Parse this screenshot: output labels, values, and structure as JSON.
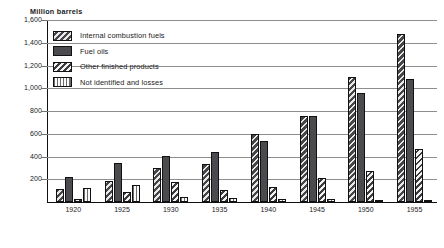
{
  "chart_data": {
    "type": "bar",
    "title": "Million barrels",
    "xlabel": "",
    "ylabel": "Million barrels",
    "ylim": [
      0,
      1600
    ],
    "yticks": [
      0,
      200,
      400,
      600,
      800,
      1000,
      1200,
      1400,
      1600
    ],
    "ytick_labels": [
      "0",
      "200",
      "400",
      "600",
      "800",
      "1,000",
      "1,200",
      "1,400",
      "1,600"
    ],
    "grid": true,
    "legend_position": "upper-left",
    "categories": [
      "1920",
      "1925",
      "1930",
      "1935",
      "1940",
      "1945",
      "1950",
      "1955"
    ],
    "series": [
      {
        "name": "Internal combustion fuels",
        "pattern": "diagonal-stripe-dark",
        "values": [
          115,
          185,
          300,
          330,
          600,
          760,
          1095,
          1480
        ]
      },
      {
        "name": "Fuel oils",
        "pattern": "solid-dark",
        "values": [
          220,
          340,
          405,
          440,
          540,
          755,
          960,
          1080
        ]
      },
      {
        "name": "Other finished products",
        "pattern": "diagonal-stripe-light",
        "values": [
          30,
          85,
          180,
          110,
          130,
          210,
          275,
          470
        ]
      },
      {
        "name": "Not identified and losses",
        "pattern": "vertical-stripe",
        "values": [
          120,
          150,
          40,
          35,
          30,
          25,
          20,
          18
        ]
      }
    ]
  },
  "legend": {
    "items": [
      {
        "label": "Internal combustion fuels",
        "pattern": "diagonal-stripe-dark"
      },
      {
        "label": "Fuel oils",
        "pattern": "solid-dark"
      },
      {
        "label": "Other finished products",
        "pattern": "diagonal-stripe-light"
      },
      {
        "label": "Not identified and losses",
        "pattern": "vertical-stripe"
      }
    ]
  },
  "colors": {
    "dark_fill": "#4b4a4f",
    "stripe_light": "#e8e8e8",
    "stripe_dark": "#3b3a3f",
    "gridline": "#8d8d8d",
    "axis": "#111111",
    "background": "#ffffff"
  }
}
